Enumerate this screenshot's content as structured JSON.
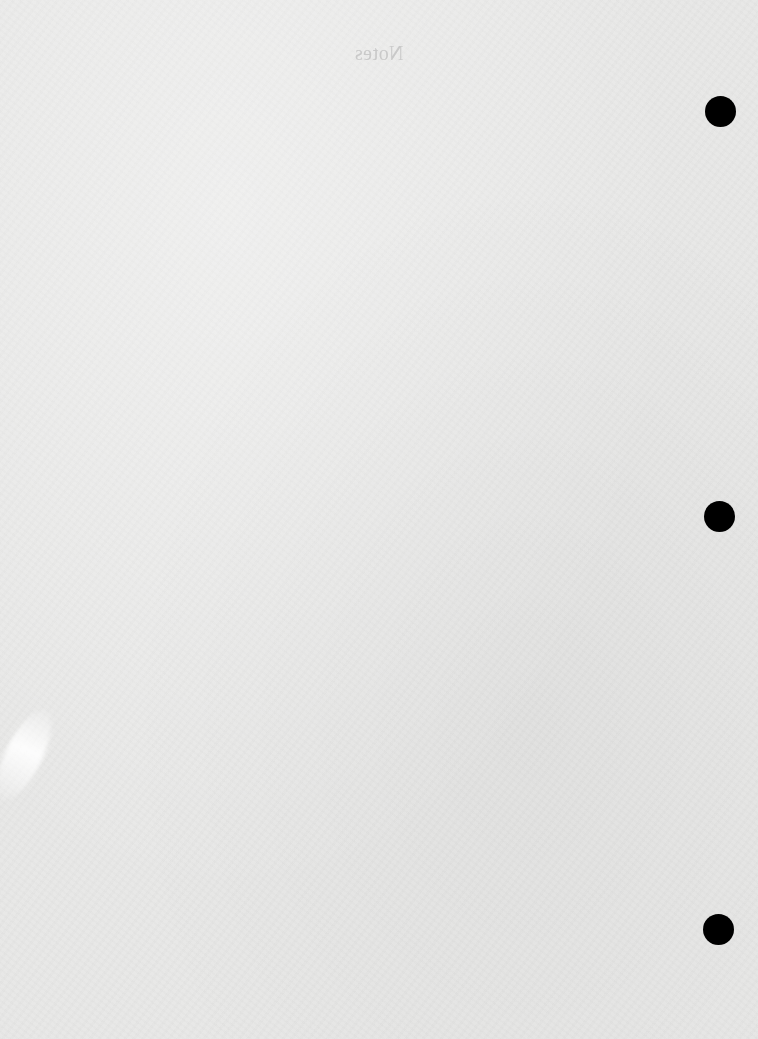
{
  "page": {
    "heading": "Notes",
    "heading_mirrored": true,
    "background_color": "#e8e8e7",
    "heading_color": "#c4c4c4"
  },
  "punch_holes": [
    {
      "name": "top",
      "cx": 721,
      "cy": 112,
      "diameter": 31,
      "color": "#000000"
    },
    {
      "name": "middle",
      "cx": 720,
      "cy": 517,
      "diameter": 31,
      "color": "#000000"
    },
    {
      "name": "bottom",
      "cx": 719,
      "cy": 930,
      "diameter": 31,
      "color": "#000000"
    }
  ]
}
